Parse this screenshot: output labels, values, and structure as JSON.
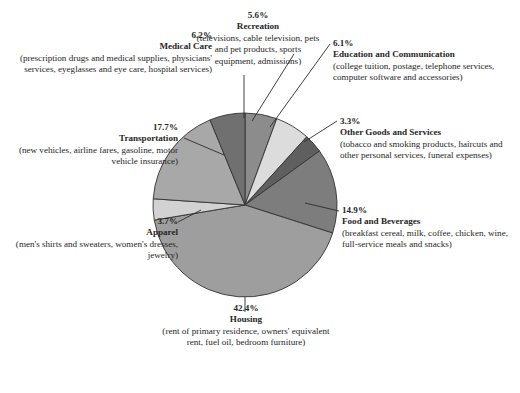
{
  "chart_data": {
    "type": "pie",
    "title": "",
    "subtitle": "",
    "xlabel": "",
    "ylabel": "",
    "legend_position": "callout-labels",
    "grid": false,
    "units": "percent",
    "categories": [
      "Recreation",
      "Education and Communication",
      "Other Goods and Services",
      "Food and Beverages",
      "Housing",
      "Apparel",
      "Transportation",
      "Medical Care"
    ],
    "values": [
      5.6,
      6.1,
      3.3,
      14.9,
      42.4,
      3.7,
      17.7,
      6.2
    ],
    "start_angle_deg": 0,
    "direction": "clockwise",
    "slices": [
      {
        "name": "Recreation",
        "percent_label": "5.6%",
        "value": 5.6,
        "color": "#8c8c8c",
        "description": "(televisions, cable television, pets and pet products, sports equipment, admissions)"
      },
      {
        "name": "Education and Communication",
        "percent_label": "6.1%",
        "value": 6.1,
        "color": "#dcdcdc",
        "description": "(college tuition, postage, telephone services, computer software and accessories)"
      },
      {
        "name": "Other Goods and Services",
        "percent_label": "3.3%",
        "value": 3.3,
        "color": "#5f5f5f",
        "description": "(tobacco and smoking products, haircuts and other personal services, funeral expenses)"
      },
      {
        "name": "Food and Beverages",
        "percent_label": "14.9%",
        "value": 14.9,
        "color": "#7d7d7d",
        "description": "(breakfast cereal, milk, coffee, chicken, wine, full-service meals and snacks)"
      },
      {
        "name": "Housing",
        "percent_label": "42.4%",
        "value": 42.4,
        "color": "#9e9e9e",
        "description": "(rent of primary residence, owners' equivalent rent, fuel oil, bedroom furniture)"
      },
      {
        "name": "Apparel",
        "percent_label": "3.7%",
        "value": 3.7,
        "color": "#d2d2d2",
        "description": "(men's shirts and sweaters, women's dresses, jewelry)"
      },
      {
        "name": "Transportation",
        "percent_label": "17.7%",
        "value": 17.7,
        "color": "#a8a8a8",
        "description": "(new vehicles, airline fares, gasoline, motor vehicle insurance)"
      },
      {
        "name": "Medical Care",
        "percent_label": "6.2%",
        "value": 6.2,
        "color": "#707070",
        "description": "(prescription drugs and medical supplies, physicians' services, eyeglasses and eye care, hospital services)"
      }
    ]
  }
}
